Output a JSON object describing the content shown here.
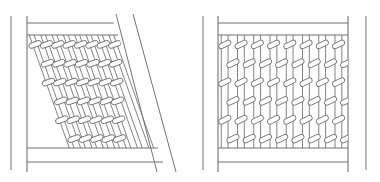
{
  "figure": {
    "title": "Knitted fabric structure comparison diagram",
    "background_color": "#ffffff",
    "line_color": "#737373",
    "bar_fill_color": "#ffffff",
    "width": 380,
    "height": 182
  },
  "panels": [
    {
      "id": "left-panel",
      "name": "sheared-fabric-panel",
      "label": "Sheared / skewed knitted fabric sample",
      "state": "deformed",
      "frame": {
        "outer_guide_x": 11,
        "left_x": 27,
        "top_rail_y": 23,
        "bottom_rail_y": 162,
        "fabric_top_y": 35,
        "fabric_bottom_y": 148,
        "top_right_x": 118,
        "bottom_right_x": 158,
        "slant_guide_1_top_x": 116,
        "slant_guide_1_bottom_x": 157,
        "slant_guide_2_top_x": 133,
        "slant_guide_2_bottom_x": 176
      },
      "grid": {
        "wales": 8,
        "courses": 6
      },
      "shear": {
        "enabled": true,
        "offset_px": 40,
        "direction": "right-down"
      }
    },
    {
      "id": "right-panel",
      "name": "relaxed-fabric-panel",
      "label": "Relaxed / undeformed knitted fabric sample",
      "state": "relaxed",
      "frame": {
        "outer_guide_left_x": 203,
        "outer_guide_right_x": 366,
        "left_x": 218,
        "right_x": 348,
        "top_rail_y": 23,
        "bottom_rail_y": 162,
        "fabric_top_y": 35,
        "fabric_bottom_y": 148
      },
      "grid": {
        "wales": 8,
        "courses": 6
      },
      "shear": {
        "enabled": false,
        "offset_px": 0,
        "direction": "none"
      }
    }
  ],
  "stitch": {
    "name": "knit-loop-cell",
    "bar_width": 13,
    "bar_height": 5.2,
    "bar_tilt_deg": -26,
    "leg_count": 2,
    "stroke_width": 0.9
  },
  "chart_data": {
    "type": "diagram",
    "title": "Knitted fabric structure comparison diagram",
    "panels": [
      {
        "name": "sheared-fabric-panel",
        "wales": 8,
        "courses": 6,
        "shear_offset_px": 40,
        "shear_angle_deg": 19.5,
        "state": "deformed"
      },
      {
        "name": "relaxed-fabric-panel",
        "wales": 8,
        "courses": 6,
        "shear_offset_px": 0,
        "shear_angle_deg": 0,
        "state": "relaxed"
      }
    ],
    "xlabel": "",
    "ylabel": "",
    "legend": [],
    "grid": false
  }
}
